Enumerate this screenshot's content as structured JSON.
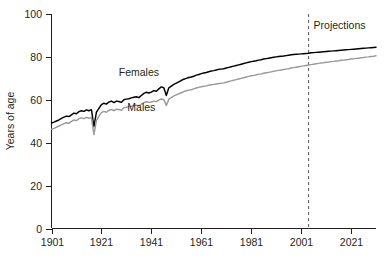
{
  "chart_data": {
    "type": "line",
    "title": "",
    "xlabel": "",
    "ylabel": "Years of age",
    "xlim": [
      1901,
      2031
    ],
    "ylim": [
      0,
      100
    ],
    "grid": false,
    "legend_position": "inline-annotation",
    "x_ticks": [
      "1901",
      "1921",
      "1941",
      "1961",
      "1981",
      "2001",
      "2021"
    ],
    "x_tick_values": [
      1901,
      1921,
      1941,
      1961,
      1981,
      2001,
      2021
    ],
    "y_ticks": [
      "0",
      "20",
      "40",
      "60",
      "80",
      "100"
    ],
    "y_tick_values": [
      0,
      20,
      40,
      60,
      80,
      100
    ],
    "annotations": [
      {
        "text": "Projections",
        "x": 2006,
        "y": 93,
        "type": "text"
      },
      {
        "text": "",
        "x": 2004,
        "type": "vertical-dashed-line"
      }
    ],
    "series": [
      {
        "name": "Females",
        "color": "#000000",
        "label_x": 1936,
        "label_y": 71,
        "x": [
          1901,
          1902,
          1903,
          1904,
          1905,
          1906,
          1907,
          1908,
          1909,
          1910,
          1911,
          1912,
          1913,
          1914,
          1915,
          1916,
          1917,
          1918,
          1919,
          1920,
          1921,
          1922,
          1923,
          1924,
          1925,
          1926,
          1927,
          1928,
          1929,
          1930,
          1931,
          1932,
          1933,
          1934,
          1935,
          1936,
          1937,
          1938,
          1939,
          1940,
          1941,
          1942,
          1943,
          1944,
          1945,
          1946,
          1947,
          1948,
          1949,
          1950,
          1951,
          1952,
          1953,
          1954,
          1955,
          1956,
          1957,
          1958,
          1959,
          1960,
          1961,
          1962,
          1963,
          1964,
          1965,
          1966,
          1967,
          1968,
          1969,
          1970,
          1971,
          1972,
          1973,
          1974,
          1975,
          1976,
          1977,
          1978,
          1979,
          1980,
          1981,
          1982,
          1983,
          1984,
          1985,
          1986,
          1987,
          1988,
          1989,
          1990,
          1991,
          1992,
          1993,
          1994,
          1995,
          1996,
          1997,
          1998,
          1999,
          2000,
          2001,
          2002,
          2003,
          2004,
          2005,
          2006,
          2007,
          2008,
          2009,
          2010,
          2011,
          2012,
          2013,
          2014,
          2015,
          2016,
          2017,
          2018,
          2019,
          2020,
          2021,
          2022,
          2023,
          2024,
          2025,
          2026,
          2027,
          2028,
          2029,
          2030,
          2031
        ],
        "y": [
          49.2,
          49.6,
          50.1,
          50.6,
          51.3,
          51.9,
          52.4,
          52.2,
          53.0,
          53.8,
          53.5,
          54.5,
          54.9,
          54.6,
          55.3,
          54.9,
          55.4,
          47.5,
          54.2,
          56.0,
          57.8,
          58.4,
          58.0,
          59.0,
          59.4,
          58.7,
          59.4,
          59.2,
          58.8,
          60.0,
          60.3,
          60.5,
          60.9,
          61.2,
          61.4,
          61.0,
          62.0,
          63.0,
          63.5,
          63.2,
          63.6,
          64.3,
          64.0,
          65.1,
          66.0,
          65.6,
          62.0,
          65.6,
          66.4,
          67.2,
          67.8,
          68.4,
          69.0,
          69.6,
          70.0,
          70.4,
          70.6,
          71.0,
          71.5,
          71.8,
          72.2,
          72.5,
          72.7,
          73.1,
          73.4,
          73.6,
          73.9,
          74.2,
          74.3,
          74.5,
          74.8,
          75.1,
          75.4,
          75.7,
          76.0,
          76.3,
          76.6,
          76.9,
          77.2,
          77.5,
          77.8,
          78.0,
          78.2,
          78.5,
          78.7,
          79.0,
          79.2,
          79.4,
          79.6,
          79.8,
          80.0,
          80.2,
          80.3,
          80.4,
          80.6,
          80.8,
          81.0,
          81.1,
          81.2,
          81.3,
          81.4,
          81.5,
          81.6,
          81.7,
          81.9,
          82.0,
          82.1,
          82.2,
          82.3,
          82.4,
          82.5,
          82.6,
          82.7,
          82.8,
          82.9,
          83.0,
          83.1,
          83.2,
          83.3,
          83.4,
          83.5,
          83.6,
          83.7,
          83.8,
          83.9,
          84.0,
          84.1,
          84.2,
          84.3,
          84.4,
          84.5
        ]
      },
      {
        "name": "Males",
        "color": "#9a9a9a",
        "label_x": 1937,
        "label_y": 55,
        "x": [
          1901,
          1902,
          1903,
          1904,
          1905,
          1906,
          1907,
          1908,
          1909,
          1910,
          1911,
          1912,
          1913,
          1914,
          1915,
          1916,
          1917,
          1918,
          1919,
          1920,
          1921,
          1922,
          1923,
          1924,
          1925,
          1926,
          1927,
          1928,
          1929,
          1930,
          1931,
          1932,
          1933,
          1934,
          1935,
          1936,
          1937,
          1938,
          1939,
          1940,
          1941,
          1942,
          1943,
          1944,
          1945,
          1946,
          1947,
          1948,
          1949,
          1950,
          1951,
          1952,
          1953,
          1954,
          1955,
          1956,
          1957,
          1958,
          1959,
          1960,
          1961,
          1962,
          1963,
          1964,
          1965,
          1966,
          1967,
          1968,
          1969,
          1970,
          1971,
          1972,
          1973,
          1974,
          1975,
          1976,
          1977,
          1978,
          1979,
          1980,
          1981,
          1982,
          1983,
          1984,
          1985,
          1986,
          1987,
          1988,
          1989,
          1990,
          1991,
          1992,
          1993,
          1994,
          1995,
          1996,
          1997,
          1998,
          1999,
          2000,
          2001,
          2002,
          2003,
          2004,
          2005,
          2006,
          2007,
          2008,
          2009,
          2010,
          2011,
          2012,
          2013,
          2014,
          2015,
          2016,
          2017,
          2018,
          2019,
          2020,
          2021,
          2022,
          2023,
          2024,
          2025,
          2026,
          2027,
          2028,
          2029,
          2030,
          2031
        ],
        "y": [
          46.3,
          46.7,
          47.2,
          47.8,
          48.3,
          48.9,
          49.3,
          49.1,
          49.9,
          50.6,
          50.3,
          51.2,
          51.6,
          51.2,
          51.8,
          51.4,
          51.7,
          43.8,
          50.3,
          52.4,
          54.0,
          54.6,
          54.2,
          55.1,
          55.5,
          54.9,
          55.6,
          55.5,
          55.1,
          56.3,
          56.5,
          56.7,
          57.0,
          57.3,
          57.5,
          57.1,
          58.0,
          58.7,
          59.1,
          58.8,
          59.0,
          59.4,
          59.1,
          59.8,
          60.4,
          60.0,
          57.4,
          60.3,
          61.0,
          61.8,
          62.3,
          62.8,
          63.3,
          63.8,
          64.2,
          64.5,
          64.7,
          65.1,
          65.5,
          65.8,
          66.1,
          66.3,
          66.5,
          66.8,
          67.0,
          67.2,
          67.4,
          67.6,
          67.7,
          67.9,
          68.2,
          68.5,
          68.8,
          69.1,
          69.4,
          69.7,
          70.0,
          70.3,
          70.6,
          70.9,
          71.2,
          71.4,
          71.6,
          71.9,
          72.1,
          72.4,
          72.6,
          72.8,
          73.0,
          73.3,
          73.5,
          73.7,
          73.9,
          74.1,
          74.3,
          74.5,
          74.8,
          75.0,
          75.2,
          75.4,
          75.6,
          75.8,
          76.0,
          76.2,
          76.4,
          76.6,
          76.8,
          77.0,
          77.2,
          77.3,
          77.5,
          77.6,
          77.8,
          77.9,
          78.1,
          78.2,
          78.4,
          78.5,
          78.7,
          78.8,
          79.0,
          79.1,
          79.3,
          79.4,
          79.6,
          79.7,
          79.9,
          80.0,
          80.2,
          80.3,
          80.5
        ]
      }
    ]
  }
}
